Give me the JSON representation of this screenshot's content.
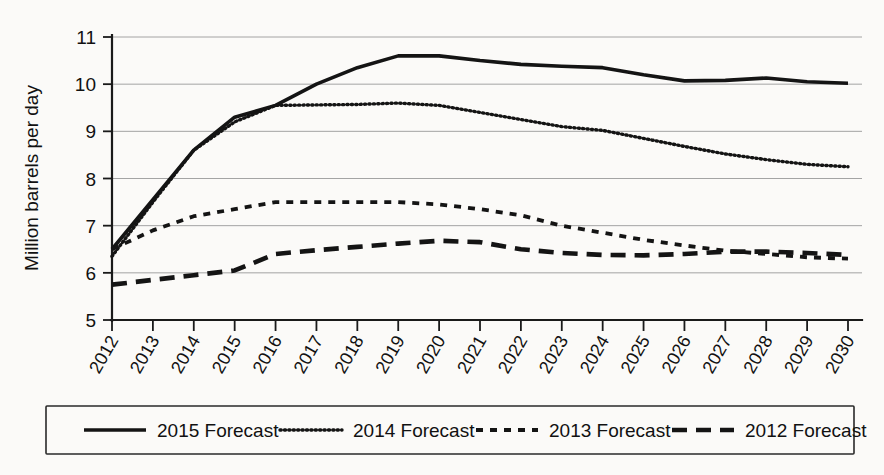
{
  "chart_data": {
    "type": "line",
    "title": "",
    "xlabel": "",
    "ylabel": "Million barrels per day",
    "x": [
      2012,
      2013,
      2014,
      2015,
      2016,
      2017,
      2018,
      2019,
      2020,
      2021,
      2022,
      2023,
      2024,
      2025,
      2026,
      2027,
      2028,
      2029,
      2030
    ],
    "categories": [
      "2012",
      "2013",
      "2014",
      "2015",
      "2016",
      "2017",
      "2018",
      "2019",
      "2020",
      "2021",
      "2022",
      "2023",
      "2024",
      "2025",
      "2026",
      "2027",
      "2028",
      "2029",
      "2030"
    ],
    "xlim": [
      2012,
      2030
    ],
    "ylim": [
      5,
      11
    ],
    "yticks": [
      5,
      6,
      7,
      8,
      9,
      10,
      11
    ],
    "grid": true,
    "legend_position": "bottom",
    "series": [
      {
        "name": "2015 Forecast",
        "style": "solid",
        "color": "#141414",
        "values": [
          6.5,
          7.55,
          8.6,
          9.3,
          9.55,
          10.0,
          10.35,
          10.6,
          10.6,
          10.5,
          10.42,
          10.38,
          10.35,
          10.2,
          10.07,
          10.08,
          10.13,
          10.05,
          10.02
        ]
      },
      {
        "name": "2014 Forecast",
        "style": "dotted",
        "color": "#141414",
        "values": [
          6.35,
          7.5,
          8.6,
          9.2,
          9.55,
          9.56,
          9.57,
          9.6,
          9.55,
          9.4,
          9.25,
          9.1,
          9.02,
          8.85,
          8.68,
          8.52,
          8.4,
          8.3,
          8.25
        ]
      },
      {
        "name": "2013 Forecast",
        "style": "dashed",
        "color": "#141414",
        "values": [
          6.5,
          6.9,
          7.2,
          7.35,
          7.5,
          7.5,
          7.5,
          7.5,
          7.45,
          7.35,
          7.22,
          7.0,
          6.85,
          6.7,
          6.58,
          6.47,
          6.4,
          6.33,
          6.3
        ]
      },
      {
        "name": "2012 Forecast",
        "style": "long-dashed",
        "color": "#141414",
        "values": [
          5.75,
          5.85,
          5.95,
          6.05,
          6.4,
          6.48,
          6.55,
          6.62,
          6.68,
          6.65,
          6.5,
          6.42,
          6.38,
          6.37,
          6.4,
          6.45,
          6.45,
          6.42,
          6.38
        ]
      }
    ]
  },
  "legend": {
    "items": [
      {
        "label": "2015 Forecast",
        "style": "solid"
      },
      {
        "label": "2014 Forecast",
        "style": "dotted"
      },
      {
        "label": "2013 Forecast",
        "style": "dashed"
      },
      {
        "label": "2012 Forecast",
        "style": "long-dashed"
      }
    ]
  }
}
